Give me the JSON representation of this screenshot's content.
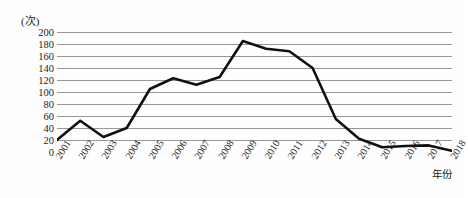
{
  "chart_data": {
    "type": "line",
    "title": "",
    "xlabel": "年份",
    "ylabel": "(次)",
    "ylim": [
      0,
      200
    ],
    "ytick_step": 20,
    "grid": true,
    "legend": "none",
    "line_color": "#111111",
    "grid_color": "#8c8c8c",
    "categories": [
      "2001",
      "2002",
      "2003",
      "2004",
      "2005",
      "2006",
      "2007",
      "2008",
      "2009",
      "2010",
      "2011",
      "2012",
      "2013",
      "2014",
      "2015",
      "2016",
      "2017",
      "2018"
    ],
    "values": [
      20,
      52,
      25,
      40,
      105,
      123,
      112,
      125,
      185,
      172,
      168,
      140,
      55,
      22,
      8,
      10,
      11,
      2
    ],
    "ytick_labels": [
      "200",
      "180",
      "160",
      "140",
      "120",
      "100",
      "80",
      "60",
      "40",
      "20",
      "0"
    ],
    "ytick_values": [
      200,
      180,
      160,
      140,
      120,
      100,
      80,
      60,
      40,
      20,
      0
    ]
  }
}
